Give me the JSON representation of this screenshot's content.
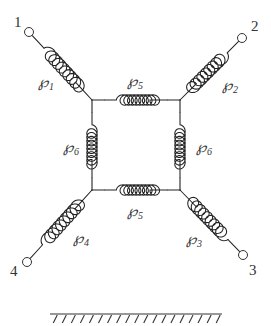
{
  "diagram": {
    "terminals": [
      {
        "id": "1",
        "label": "1",
        "x": 29,
        "y": 32,
        "lx": 14,
        "ly": 27
      },
      {
        "id": "2",
        "label": "2",
        "x": 242,
        "y": 38,
        "lx": 251,
        "ly": 31
      },
      {
        "id": "3",
        "label": "3",
        "x": 243,
        "y": 255,
        "lx": 249,
        "ly": 275
      },
      {
        "id": "4",
        "label": "4",
        "x": 27,
        "y": 262,
        "lx": 10,
        "ly": 276
      }
    ],
    "junctions": [
      {
        "id": "TL",
        "x": 92,
        "y": 100
      },
      {
        "id": "TR",
        "x": 180,
        "y": 100
      },
      {
        "id": "BR",
        "x": 180,
        "y": 190
      },
      {
        "id": "BL",
        "x": 92,
        "y": 190
      }
    ],
    "springs": [
      {
        "id": "P1",
        "symbol": "℘",
        "sub": "1",
        "from": "1",
        "to": "TL",
        "lx": 38,
        "ly": 87
      },
      {
        "id": "P2",
        "symbol": "℘",
        "sub": "2",
        "from": "2",
        "to": "TR",
        "lx": 222,
        "ly": 90
      },
      {
        "id": "P3",
        "symbol": "℘",
        "sub": "3",
        "from": "3",
        "to": "BR",
        "lx": 186,
        "ly": 244
      },
      {
        "id": "P4",
        "symbol": "℘",
        "sub": "4",
        "from": "4",
        "to": "BL",
        "lx": 73,
        "ly": 243
      },
      {
        "id": "P5_top",
        "symbol": "℘",
        "sub": "5",
        "from": "TL",
        "to": "TR",
        "lx": 127,
        "ly": 86
      },
      {
        "id": "P5_bottom",
        "symbol": "℘",
        "sub": "5",
        "from": "BL",
        "to": "BR",
        "lx": 127,
        "ly": 216
      },
      {
        "id": "P6_left",
        "symbol": "℘",
        "sub": "6",
        "from": "TL",
        "to": "BL",
        "lx": 63,
        "ly": 152
      },
      {
        "id": "P6_right",
        "symbol": "℘",
        "sub": "6",
        "from": "TR",
        "to": "BR",
        "lx": 196,
        "ly": 152
      }
    ],
    "ground": {
      "x1": 50,
      "x2": 222,
      "y": 314,
      "hatch_count": 19
    }
  },
  "labels": {
    "t1": "1",
    "t2": "2",
    "t3": "3",
    "t4": "4",
    "p": "℘",
    "s1": "1",
    "s2": "2",
    "s3": "3",
    "s4": "4",
    "s5": "5",
    "s6": "6"
  }
}
